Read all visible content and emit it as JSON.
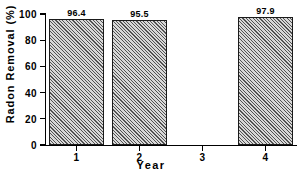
{
  "chart_data": {
    "type": "bar",
    "title": "",
    "xlabel": "Year",
    "ylabel": "Radon Removal (%)",
    "categories": [
      "1",
      "2",
      "3",
      "4"
    ],
    "values": [
      96.4,
      95.5,
      null,
      97.9
    ],
    "data_labels": [
      "96.4",
      "95.5",
      "",
      "97.9"
    ],
    "ylim": [
      0,
      100
    ],
    "yticks": [
      0,
      20,
      40,
      60,
      80,
      100
    ],
    "ytick_labels": [
      "0",
      "20",
      "40",
      "60",
      "80",
      "100"
    ],
    "xtick_labels": [
      "1",
      "2",
      "3",
      "4"
    ],
    "grid": false,
    "legend": false,
    "bar_fill": "#d8d8d8",
    "bar_hatch": "diagonal-45",
    "bar_edge_color": "#1a1a1a",
    "axis_color": "#000000",
    "background": "#ffffff"
  }
}
